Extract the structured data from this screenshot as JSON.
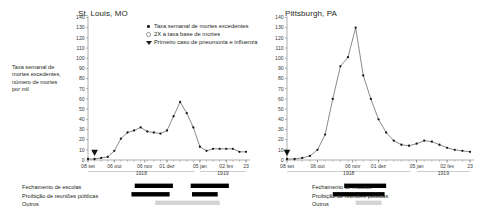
{
  "figure": {
    "y_axis_caption": "Taxa semanal de mortes excedentes, número de mortes por mil"
  },
  "legend": {
    "items": [
      {
        "marker": "dot-marker",
        "label": "Taxa semanal de mortes excedentes"
      },
      {
        "marker": "open-circle-marker",
        "label": "2X a taxa base de mortes"
      },
      {
        "marker": "triangle-marker",
        "label": "Primeiro caso de pneumonia e influenza"
      }
    ]
  },
  "interventions": {
    "labels": [
      "Fechamento de escolas",
      "Proibição de reuniões públicas",
      "Outros"
    ]
  },
  "axis": {
    "y_ticks": [
      "140",
      "130",
      "120",
      "110",
      "100",
      "90",
      "80",
      "70",
      "60",
      "50",
      "40",
      "30",
      "20",
      "10",
      "0"
    ],
    "x_ticks": [
      "08 set",
      "06 out",
      "06 nov",
      "01 dez",
      "05 jan",
      "02 fev",
      "23"
    ],
    "years": [
      "1918",
      "1919"
    ]
  },
  "chart_data": [
    {
      "type": "line",
      "title": "St. Louis, MO",
      "xlabel": "",
      "ylabel": "Taxa semanal de mortes excedentes, número de mortes por mil",
      "ylim": [
        0,
        140
      ],
      "grid": false,
      "legend_position": "top-right",
      "x": [
        "08 set",
        "15 set",
        "22 set",
        "29 set",
        "06 out",
        "13 out",
        "20 out",
        "27 out",
        "03 nov",
        "10 nov",
        "17 nov",
        "24 nov",
        "01 dez",
        "08 dez",
        "15 dez",
        "22 dez",
        "29 dez",
        "05 jan",
        "12 jan",
        "19 jan",
        "26 jan",
        "02 fev",
        "09 fev",
        "16 fev",
        "23 fev"
      ],
      "values": [
        1,
        1,
        2,
        3,
        9,
        21,
        27,
        29,
        32,
        28,
        27,
        26,
        29,
        43,
        57,
        46,
        32,
        13,
        9,
        11,
        11,
        11,
        11,
        8,
        8
      ],
      "annotations": [
        {
          "name": "primeiro-caso-triangle",
          "x_index": 1,
          "label": "Primeiro caso de pneumonia e influenza"
        }
      ],
      "interventions": [
        {
          "label": "Fechamento de escolas",
          "segments": [
            [
              7.1,
              12.9
            ],
            [
              15.6,
              21.4
            ]
          ]
        },
        {
          "label": "Proibição de reuniões públicas",
          "segments": [
            [
              6.6,
              12.4
            ],
            [
              15.8,
              19.7
            ]
          ]
        },
        {
          "label": "Outros",
          "segments": [
            [
              10.2,
              20.0
            ]
          ]
        }
      ]
    },
    {
      "type": "line",
      "title": "Pittsburgh, PA",
      "xlabel": "",
      "ylabel": "Taxa semanal de mortes excedentes, número de mortes por mil",
      "ylim": [
        0,
        140
      ],
      "grid": false,
      "legend_position": "none",
      "x": [
        "08 set",
        "15 set",
        "22 set",
        "29 set",
        "06 out",
        "13 out",
        "20 out",
        "27 out",
        "03 nov",
        "10 nov",
        "17 nov",
        "24 nov",
        "01 dez",
        "08 dez",
        "15 dez",
        "22 dez",
        "29 dez",
        "05 jan",
        "12 jan",
        "19 jan",
        "26 jan",
        "02 fev",
        "09 fev",
        "16 fev",
        "23 fev"
      ],
      "values": [
        1,
        1,
        2,
        4,
        10,
        25,
        60,
        92,
        101,
        130,
        83,
        60,
        40,
        27,
        19,
        15,
        14,
        16,
        19,
        18,
        15,
        12,
        10,
        9,
        8
      ],
      "annotations": [
        {
          "name": "primeiro-caso-triangle",
          "x_index": 0,
          "label": "Primeiro caso de pneumonia e influenza"
        }
      ],
      "interventions": [
        {
          "label": "Fechamento de escolas",
          "segments": [
            [
              7.5,
              13.0
            ]
          ]
        },
        {
          "label": "Proibição de reuniões públicas",
          "segments": [
            [
              6.0,
              12.8
            ]
          ]
        },
        {
          "label": "Outros",
          "segments": [
            [
              9.0,
              12.4
            ]
          ]
        }
      ]
    }
  ]
}
